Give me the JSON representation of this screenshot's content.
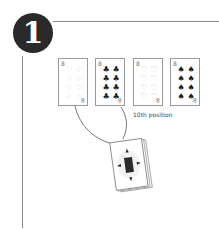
{
  "diagram": {
    "step_number": "1",
    "cards": [
      {
        "rank": "8",
        "suit": "diamonds",
        "symbol": "♢",
        "style": "outline"
      },
      {
        "rank": "8",
        "suit": "clubs",
        "symbol": "♣",
        "style": "solid"
      },
      {
        "rank": "8",
        "suit": "hearts",
        "symbol": "♡",
        "style": "outline"
      },
      {
        "rank": "8",
        "suit": "spades",
        "symbol": "♠",
        "style": "solid"
      }
    ],
    "deck_label": "10th position",
    "deck": {
      "description": "face-down deck of cards",
      "back_icon": "diamond-card-back"
    },
    "colors": {
      "badge": "#2a2a2a",
      "rule": "#8a8a8a",
      "card_border": "#9a9a9a",
      "solid_suit": "#1e1e1e",
      "outline_suit": "#c9c9c9"
    }
  }
}
